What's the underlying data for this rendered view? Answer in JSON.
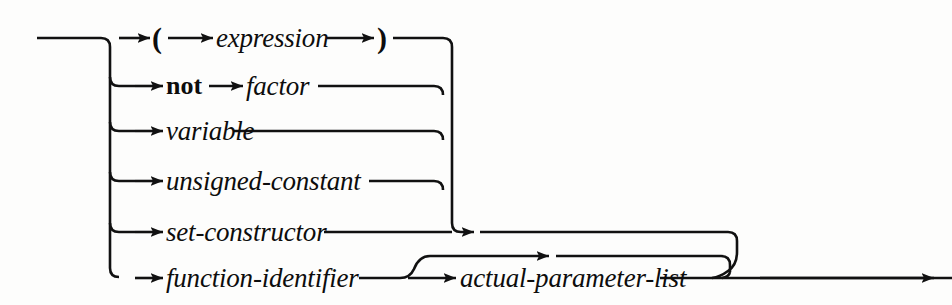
{
  "diagram": {
    "kind": "railroad-syntax-diagram",
    "rule_name": "factor",
    "ink_color": "#111111",
    "background_color": "#fdfdfc",
    "entry_label": "",
    "exit_label": "",
    "alternatives": [
      {
        "row": 1,
        "sequence": [
          "(",
          "expression",
          ")"
        ],
        "items": [
          {
            "text": "(",
            "type": "terminal"
          },
          {
            "text": "expression",
            "type": "nonterminal"
          },
          {
            "text": ")",
            "type": "terminal"
          }
        ]
      },
      {
        "row": 2,
        "sequence": [
          "not",
          "factor"
        ],
        "items": [
          {
            "text": "not",
            "type": "terminal"
          },
          {
            "text": "factor",
            "type": "nonterminal"
          }
        ]
      },
      {
        "row": 3,
        "sequence": [
          "variable"
        ],
        "items": [
          {
            "text": "variable",
            "type": "nonterminal"
          }
        ]
      },
      {
        "row": 4,
        "sequence": [
          "unsigned-constant"
        ],
        "items": [
          {
            "text": "unsigned-constant",
            "type": "nonterminal"
          }
        ]
      },
      {
        "row": 5,
        "sequence": [
          "set-constructor"
        ],
        "items": [
          {
            "text": "set-constructor",
            "type": "nonterminal"
          }
        ]
      },
      {
        "row": 6,
        "sequence": [
          "function-identifier",
          "actual-parameter-list"
        ],
        "items": [
          {
            "text": "function-identifier",
            "type": "nonterminal"
          },
          {
            "text": "actual-parameter-list",
            "type": "nonterminal",
            "optional": true
          }
        ]
      }
    ],
    "labels": {
      "open_paren": "(",
      "expression": "expression",
      "close_paren": ")",
      "not": "not",
      "factor": "factor",
      "variable": "variable",
      "unsigned_constant": "unsigned-constant",
      "set_constructor": "set-constructor",
      "function_identifier": "function-identifier",
      "actual_parameter_list": "actual-parameter-list"
    }
  }
}
